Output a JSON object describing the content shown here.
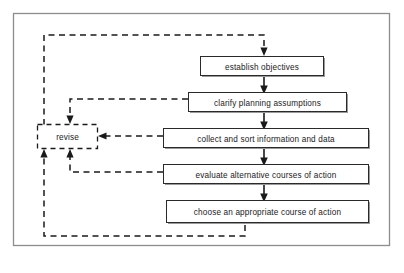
{
  "diagram": {
    "frame": {
      "name": "outer-border"
    },
    "colors": {
      "background": "#ffffff",
      "box_border": "#2a2a2a",
      "box_shadow": "#9a9a9a",
      "connector": "#1a1a1a",
      "frame": "#8d8d8d"
    },
    "nodes": [
      {
        "id": "establish",
        "label": "establish objectives",
        "shape": "rectangle",
        "border": "solid"
      },
      {
        "id": "clarify",
        "label": "clarify planning assumptions",
        "shape": "rectangle",
        "border": "solid"
      },
      {
        "id": "collect",
        "label": "collect and sort information and data",
        "shape": "rectangle",
        "border": "solid"
      },
      {
        "id": "evaluate",
        "label": "evaluate alternative courses of action",
        "shape": "rectangle",
        "border": "solid"
      },
      {
        "id": "choose",
        "label": "choose an appropriate course of action",
        "shape": "rectangle",
        "border": "solid"
      },
      {
        "id": "revise",
        "label": "revise",
        "shape": "rectangle",
        "border": "dashed"
      }
    ],
    "edges": [
      {
        "from": "top-entry",
        "to": "establish",
        "style": "solid",
        "arrow": "down"
      },
      {
        "from": "establish",
        "to": "clarify",
        "style": "solid",
        "arrow": "down"
      },
      {
        "from": "clarify",
        "to": "collect",
        "style": "solid",
        "arrow": "down"
      },
      {
        "from": "collect",
        "to": "evaluate",
        "style": "solid",
        "arrow": "down"
      },
      {
        "from": "evaluate",
        "to": "choose",
        "style": "solid",
        "arrow": "down"
      },
      {
        "from": "clarify",
        "to": "revise",
        "style": "dashed",
        "arrow": "down"
      },
      {
        "from": "collect",
        "to": "revise",
        "style": "dashed",
        "arrow": "left"
      },
      {
        "from": "evaluate",
        "to": "revise",
        "style": "dashed",
        "arrow": "up"
      },
      {
        "from": "choose",
        "to": "revise",
        "style": "dashed",
        "arrow": "up"
      },
      {
        "from": "revise",
        "to": "establish",
        "style": "dashed",
        "arrow": "down"
      }
    ]
  }
}
